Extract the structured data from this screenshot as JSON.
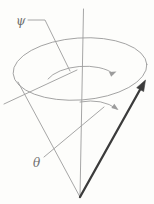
{
  "diagram": {
    "labels": {
      "psi": "ψ",
      "theta": "θ"
    },
    "colors": {
      "background": "#fdfdfb",
      "line": "#9c9c9c",
      "vector": "#3b3b3b",
      "label": "#6f6f6f"
    }
  }
}
